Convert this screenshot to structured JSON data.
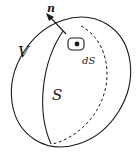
{
  "diagram": {
    "type": "closed-surface-with-normal",
    "labels": {
      "volume": "V",
      "surface": "S",
      "surface_element": "dS",
      "normal": "n"
    },
    "colors": {
      "stroke": "#1a1a1a",
      "background": "#ffffff"
    }
  }
}
